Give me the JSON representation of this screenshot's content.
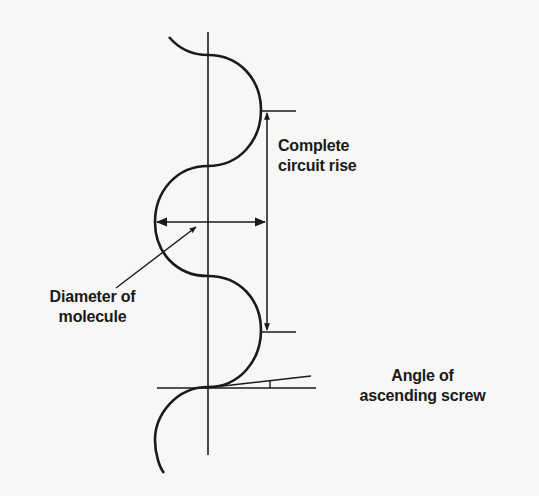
{
  "diagram": {
    "type": "helix-side-view",
    "labels": {
      "circuit_rise": {
        "line1": "Complete",
        "line2": "circuit rise"
      },
      "diameter": {
        "line1": "Diameter of",
        "line2": "molecule"
      },
      "angle": {
        "line1": "Angle of",
        "line2": "ascending screw"
      }
    },
    "colors": {
      "ink": "#1a1a1a",
      "background": "#f7f7f5"
    }
  }
}
